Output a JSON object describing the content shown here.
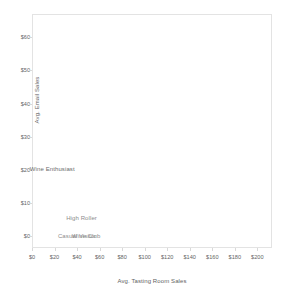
{
  "chart_data": {
    "type": "scatter",
    "title": "",
    "xlabel": "Avg. Tasting Room Sales",
    "ylabel": "Avg. Email Sales",
    "xlim": [
      0,
      213
    ],
    "ylim": [
      -3.5,
      67
    ],
    "grid": false,
    "legend": "none",
    "markers_visible": false,
    "xticks": [
      {
        "value": 0,
        "label": "$0"
      },
      {
        "value": 20,
        "label": "$20"
      },
      {
        "value": 40,
        "label": "$40"
      },
      {
        "value": 60,
        "label": "$60"
      },
      {
        "value": 80,
        "label": "$80"
      },
      {
        "value": 100,
        "label": "$100"
      },
      {
        "value": 120,
        "label": "$120"
      },
      {
        "value": 140,
        "label": "$140"
      },
      {
        "value": 160,
        "label": "$160"
      },
      {
        "value": 180,
        "label": "$180"
      },
      {
        "value": 200,
        "label": "$200"
      }
    ],
    "yticks": [
      {
        "value": 0,
        "label": "$0"
      },
      {
        "value": 10,
        "label": "$10"
      },
      {
        "value": 20,
        "label": "$20"
      },
      {
        "value": 30,
        "label": "$30"
      },
      {
        "value": 40,
        "label": "$40"
      },
      {
        "value": 50,
        "label": "$50"
      },
      {
        "value": 60,
        "label": "$60"
      }
    ],
    "points": [
      {
        "label": "Wine Enthusiast",
        "x": 18,
        "y": 20.2,
        "shade": "dark"
      },
      {
        "label": "High Roller",
        "x": 44,
        "y": 5.4,
        "shade": "light"
      },
      {
        "label": "Casual Visitor",
        "x": 40,
        "y": 0.2,
        "shade": "light"
      },
      {
        "label": "Wine Club",
        "x": 48,
        "y": 0.2,
        "shade": "light"
      }
    ]
  }
}
